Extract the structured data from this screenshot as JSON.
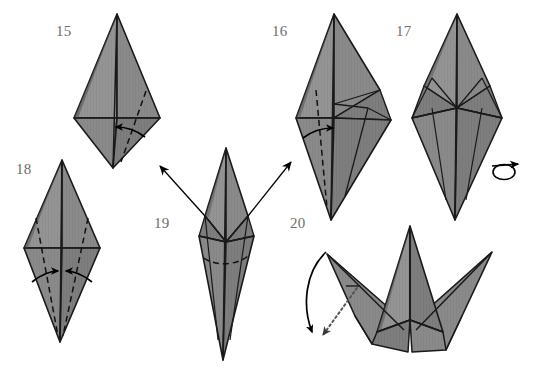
{
  "document": {
    "title": "Origami Crane Folding Diagram",
    "kind": "instructional-diagram",
    "background_color": "#ffffff"
  },
  "palette": {
    "paper_fill": "#8a8a8a",
    "paper_fill_light": "#949494",
    "paper_fill_dark": "#7c7c7c",
    "outline": "#1a1a1a",
    "crease_solid": "#1a1a1a",
    "crease_dashed": "#111111",
    "arrow": "#000000",
    "dotted_arrow": "#555555",
    "label_text": "#6e6e6e"
  },
  "steps": [
    {
      "id": "step-15",
      "number": "15",
      "label_x": 56,
      "label_y": 36,
      "description": "Diamond with vertical centre crease, horizontal midline and a dashed valley fold on the right; curved arrow folds the right flap to the left.",
      "annotations": {
        "fold_lines": [
          "vertical-centre",
          "horizontal-midline",
          "dashed-right-diagonal"
        ],
        "arrow": "curved-arrow-left"
      }
    },
    {
      "id": "step-16",
      "number": "16",
      "label_x": 272,
      "label_y": 36,
      "description": "Same diamond after the right flap is folded, showing faceted right side; dashed valley fold on the left with a curved arrow folding to the right.",
      "annotations": {
        "fold_lines": [
          "vertical-centre",
          "horizontal-midline",
          "dashed-left-diagonal",
          "right-facets"
        ],
        "arrow": "curved-arrow-right"
      }
    },
    {
      "id": "step-17",
      "number": "17",
      "label_x": 396,
      "label_y": 36,
      "description": "Symmetric faceted diamond with both flaps folded; turn-over symbol at the right indicates flipping the model.",
      "annotations": {
        "fold_lines": [
          "vertical-centre",
          "left-facets",
          "right-facets"
        ],
        "symbol": "turn-over-icon"
      }
    },
    {
      "id": "step-18",
      "number": "18",
      "label_x": 16,
      "label_y": 174,
      "description": "Narrow diamond with two symmetric dashed valley folds; two curved arrows point inward to bring both lower edges to the centre line.",
      "annotations": {
        "fold_lines": [
          "vertical-centre",
          "horizontal-midline",
          "dashed-left-diagonal",
          "dashed-right-diagonal"
        ],
        "arrows": [
          "curved-arrow-right-inward",
          "curved-arrow-left-inward"
        ]
      }
    },
    {
      "id": "step-19",
      "number": "19",
      "label_x": 154,
      "label_y": 228,
      "description": "Slim elongated kite after the inward folds; a dashed horizontal crease marks the wing fold and two straight arrows point outward up-left and up-right.",
      "annotations": {
        "fold_lines": [
          "vertical-centre",
          "upper-facets",
          "dashed-horizontal-crease"
        ],
        "arrows": [
          "straight-arrow-up-left",
          "straight-arrow-up-right"
        ]
      }
    },
    {
      "id": "step-20",
      "number": "20",
      "label_x": 290,
      "label_y": 228,
      "description": "Crane form with both wings spread outward; a curved arrow and a dotted hidden-fold arrow at the left show the head being folded down.",
      "annotations": {
        "fold_lines": [
          "vertical-centre",
          "wing-creases",
          "body-creases"
        ],
        "arrows": [
          "curved-arrow-down-left",
          "dotted-arrow-down-left"
        ]
      }
    }
  ],
  "symbols": {
    "turn_over": {
      "name": "turn-over-icon",
      "x": 505,
      "y": 168,
      "meaning": "Turn the model over"
    }
  },
  "flow": [
    {
      "from": "step-15",
      "to": "step-16"
    },
    {
      "from": "step-16",
      "to": "step-17"
    },
    {
      "from": "step-17",
      "to": "step-18"
    },
    {
      "from": "step-18",
      "to": "step-19"
    },
    {
      "from": "step-19",
      "to": "step-20"
    }
  ]
}
